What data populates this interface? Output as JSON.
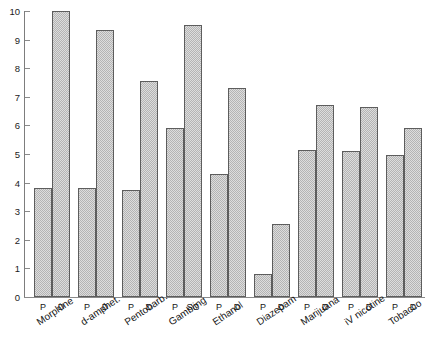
{
  "chart_data": {
    "type": "bar",
    "title": "",
    "xlabel": "",
    "ylabel": "",
    "ylim": [
      0,
      10
    ],
    "ytick_labels": [
      "0",
      "1",
      "2",
      "3",
      "4",
      "5",
      "6",
      "7",
      "8",
      "9",
      "10"
    ],
    "ytick_values": [
      0,
      1,
      2,
      3,
      4,
      5,
      6,
      7,
      8,
      9,
      10
    ],
    "grid": false,
    "legend": "none",
    "categories": [
      "Morphine",
      "d-amphet.",
      "Pentobarb.",
      "Gambling",
      "Ethanol",
      "Diazepam",
      "Marijuana",
      "iV nicotine",
      "Tobacco"
    ],
    "groups": [
      {
        "label": "Morphine",
        "bars": [
          {
            "series": "P",
            "value": 3.8
          },
          {
            "series": "D",
            "value": 10.0
          }
        ]
      },
      {
        "label": "d-amphet.",
        "bars": [
          {
            "series": "P",
            "value": 3.8
          },
          {
            "series": "D",
            "value": 9.35
          }
        ]
      },
      {
        "label": "Pentobarb.",
        "bars": [
          {
            "series": "P",
            "value": 3.75
          },
          {
            "series": "D",
            "value": 7.55
          }
        ]
      },
      {
        "label": "Gambling",
        "bars": [
          {
            "series": "P",
            "value": 5.9
          },
          {
            "series": "SG",
            "value": 9.5
          }
        ]
      },
      {
        "label": "Ethanol",
        "bars": [
          {
            "series": "P",
            "value": 4.3
          },
          {
            "series": "D",
            "value": 7.3
          }
        ]
      },
      {
        "label": "Diazepam",
        "bars": [
          {
            "series": "P",
            "value": 0.8
          },
          {
            "series": "D",
            "value": 2.55
          }
        ]
      },
      {
        "label": "Marijuana",
        "bars": [
          {
            "series": "P",
            "value": 5.15
          },
          {
            "series": "D",
            "value": 6.7
          }
        ]
      },
      {
        "label": "iV nicotine",
        "bars": [
          {
            "series": "P",
            "value": 5.1
          },
          {
            "series": "D",
            "value": 6.65
          }
        ]
      },
      {
        "label": "Tobacco",
        "bars": [
          {
            "series": "P",
            "value": 4.95
          },
          {
            "series": "D",
            "value": 5.9
          }
        ]
      }
    ],
    "series_names": [
      "P",
      "D",
      "SG"
    ],
    "bar_color": "#b4b4b4",
    "bar_edge_color": "#5d5d5d",
    "axis_color": "#8a8a8a"
  }
}
